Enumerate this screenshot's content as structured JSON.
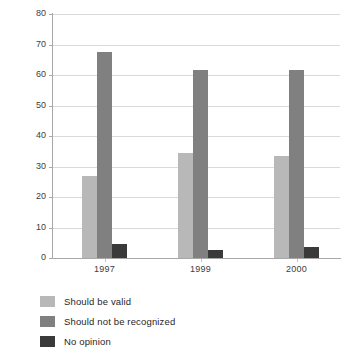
{
  "chart_data": {
    "type": "bar",
    "title": "",
    "subtitle": "",
    "xlabel": "",
    "ylabel": "Percentage",
    "categories": [
      "1997",
      "1999",
      "2000"
    ],
    "series": [
      {
        "name": "Should be valid",
        "color": "#b8b8b8",
        "values": [
          27,
          34.5,
          33.5
        ]
      },
      {
        "name": "Should not be recognized",
        "color": "#808080",
        "values": [
          67.5,
          61.5,
          61.5
        ]
      },
      {
        "name": "No opinion",
        "color": "#3a3a3a",
        "values": [
          4.5,
          2.5,
          3.5
        ]
      }
    ],
    "ylim": [
      0,
      80
    ],
    "ytick_step": 10,
    "yticks": [
      "80",
      "70",
      "60",
      "50",
      "40",
      "30",
      "20",
      "10",
      "0"
    ],
    "grid": true,
    "grid_color": "#d9d9d9",
    "axis_color": "#a8a8a8",
    "legend_position": "below-left",
    "orientation": "vertical",
    "grouped": true
  },
  "axis": {
    "y_title": "Percentage"
  },
  "legend": {
    "items": [
      {
        "label": "Should be valid",
        "swatch": "legend-swatch-valid"
      },
      {
        "label": "Should not be recognized",
        "swatch": "legend-swatch-not-recognized"
      },
      {
        "label": "No opinion",
        "swatch": "legend-swatch-no-opinion"
      }
    ]
  }
}
